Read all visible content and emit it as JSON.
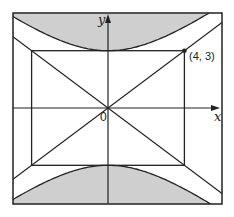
{
  "diagram": {
    "type": "hyperbola-asymptote-figure",
    "frame": {
      "x_range": [
        -5,
        6
      ],
      "y_range": [
        -5,
        5
      ]
    },
    "hyperbola": {
      "equation": "y^2/9 - x^2/16 = 1",
      "a_y": 3,
      "b_x": 4,
      "shaded_region": "outside branches (|y| beyond curve)"
    },
    "rectangle": {
      "x_range": [
        -4,
        4
      ],
      "y_range": [
        -3,
        3
      ]
    },
    "asymptotes": [
      {
        "slope": 0.75
      },
      {
        "slope": -0.75
      }
    ],
    "labels": {
      "x_axis": "x",
      "y_axis": "y",
      "origin": "0",
      "point": "(4, 3)"
    },
    "marked_point": {
      "x": 4,
      "y": 3
    },
    "colors": {
      "shade": "#cfcfcf",
      "stroke": "#222222",
      "background": "#ffffff"
    }
  }
}
